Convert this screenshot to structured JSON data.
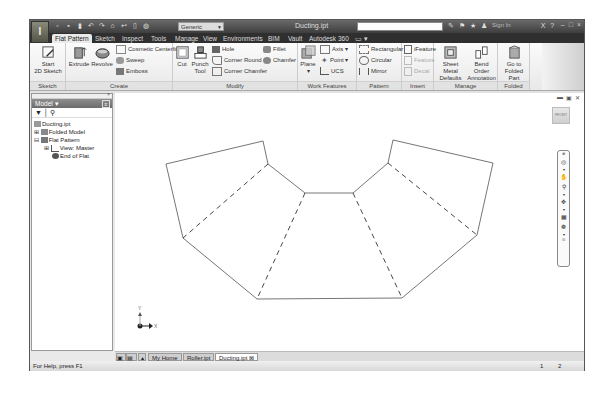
{
  "titlebar": {
    "app_button": "I",
    "quick_access_icons": [
      "new-icon",
      "open-icon",
      "save-icon",
      "undo-icon",
      "redo-icon",
      "home-icon",
      "return-icon",
      "select-icon",
      "material-icon"
    ],
    "appearance_select": "Generic",
    "document_title": "Ducting.ipt",
    "search_placeholder": "",
    "sign_in": "Sign In",
    "window_controls": {
      "minimize": "–",
      "restore": "□",
      "close": "×"
    }
  },
  "tabs": [
    {
      "label": "Flat Pattern",
      "active": true
    },
    {
      "label": "Sketch"
    },
    {
      "label": "Inspect"
    },
    {
      "label": "Tools"
    },
    {
      "label": "Manage"
    },
    {
      "label": "View"
    },
    {
      "label": "Environments"
    },
    {
      "label": "BIM"
    },
    {
      "label": "Vault"
    },
    {
      "label": "Autodesk 360"
    }
  ],
  "ribbon": {
    "sketch": {
      "label": "Sketch",
      "start_sketch": "Start",
      "start_sketch2": "2D Sketch"
    },
    "create": {
      "label": "Create",
      "extrude": "Extrude",
      "revolve": "Revolve",
      "cosmetic_centerline": "Cosmetic Centerline",
      "sweep": "Sweep",
      "emboss": "Emboss"
    },
    "modify": {
      "label": "Modify",
      "cut": "Cut",
      "punch_tool": "Punch",
      "punch_tool2": "Tool",
      "hole": "Hole",
      "corner_round": "Corner Round",
      "corner_chamfer": "Corner Chamfer",
      "fillet": "Fillet",
      "chamfer": "Chamfer"
    },
    "work_features": {
      "label": "Work Features",
      "plane": "Plane",
      "axis": "Axis",
      "point": "Point",
      "ucs": "UCS"
    },
    "pattern": {
      "label": "Pattern",
      "rectangular": "Rectangular",
      "circular": "Circular",
      "mirror": "Mirror"
    },
    "insert": {
      "label": "Insert",
      "ifeature": "iFeature",
      "feature": "Feature",
      "decal": "Decal"
    },
    "manage": {
      "label": "Manage",
      "sheet_metal_defaults": "Sheet Metal",
      "sheet_metal_defaults2": "Defaults",
      "bend_order": "Bend Order",
      "bend_order2": "Annotation"
    },
    "folded_part": {
      "label": "Folded Part",
      "go_to": "Go to",
      "go_to2": "Folded Part"
    }
  },
  "browser": {
    "title": "Model",
    "tree": [
      {
        "label": "Ducting.ipt",
        "level": 0
      },
      {
        "label": "Folded Model",
        "level": 1
      },
      {
        "label": "Flat Pattern",
        "level": 1
      },
      {
        "label": "View: Master",
        "level": 2
      },
      {
        "label": "End of Flat",
        "level": 2
      }
    ]
  },
  "canvas": {
    "viewcube_label": "FRONT",
    "axis_labels": {
      "x": "X",
      "y": "Y"
    },
    "nav_tools": [
      "steering-wheel-icon",
      "pan-icon",
      "zoom-icon",
      "orbit-icon",
      "look-at-icon",
      "free-orbit-icon"
    ]
  },
  "doc_tabs": [
    {
      "label": "My Home"
    },
    {
      "label": "Roller.ipt"
    },
    {
      "label": "Ducting.ipt",
      "active": true
    }
  ],
  "status": {
    "help": "For Help, press F1",
    "count1": "1",
    "count2": "2"
  }
}
